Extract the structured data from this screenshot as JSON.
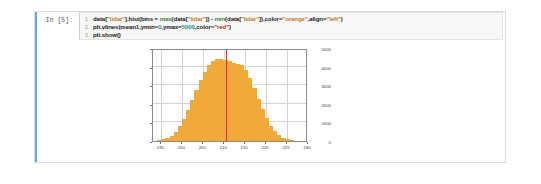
{
  "cell": {
    "prompt_label": "In [5]:",
    "code_lines": [
      {
        "number": "1",
        "segments": [
          {
            "text": "data[",
            "type": "plain"
          },
          {
            "text": "\"lidar\"",
            "type": "string"
          },
          {
            "text": "].hist(bins = ",
            "type": "plain"
          },
          {
            "text": "max",
            "type": "function"
          },
          {
            "text": "(data[",
            "type": "plain"
          },
          {
            "text": "\"lidar\"",
            "type": "string"
          },
          {
            "text": "]) - ",
            "type": "plain"
          },
          {
            "text": "min",
            "type": "function"
          },
          {
            "text": "(data[",
            "type": "plain"
          },
          {
            "text": "\"lidar\"",
            "type": "string"
          },
          {
            "text": "]),color=",
            "type": "plain"
          },
          {
            "text": "\"orange\"",
            "type": "string"
          },
          {
            "text": ",align=",
            "type": "plain"
          },
          {
            "text": "\"left\"",
            "type": "string"
          },
          {
            "text": ")",
            "type": "plain"
          }
        ]
      },
      {
        "number": "2",
        "segments": [
          {
            "text": "plt.vlines(mean1,ymin=",
            "type": "plain"
          },
          {
            "text": "0",
            "type": "number"
          },
          {
            "text": ",ymax=",
            "type": "plain"
          },
          {
            "text": "5000",
            "type": "number"
          },
          {
            "text": ",color=",
            "type": "plain"
          },
          {
            "text": "\"red\"",
            "type": "red-string"
          },
          {
            "text": ")",
            "type": "plain"
          }
        ]
      },
      {
        "number": "3",
        "segments": [
          {
            "text": "plt.show()",
            "type": "plain"
          }
        ]
      }
    ]
  },
  "colors": {
    "bar_color": "#f2a93b",
    "vline_color": "#e02b2b",
    "cell_accent": "#69a9e0",
    "code_background": "#f7f7f7"
  },
  "chart_data": {
    "type": "bar",
    "title": "",
    "xlabel": "",
    "ylabel": "",
    "xlim": [
      193,
      230
    ],
    "ylim": [
      0,
      5000
    ],
    "grid": true,
    "legend": null,
    "ytick_labels": [
      "5000",
      "4000",
      "3000",
      "2000",
      "1000",
      "0"
    ],
    "ytick_values": [
      5000,
      4000,
      3000,
      2000,
      1000,
      0
    ],
    "xtick_labels": [
      "195",
      "200",
      "205",
      "210",
      "215",
      "220",
      "225",
      "230"
    ],
    "xtick_values": [
      195,
      200,
      205,
      210,
      215,
      220,
      225,
      230
    ],
    "bin_centers": [
      193,
      194,
      195,
      196,
      197,
      198,
      199,
      200,
      201,
      202,
      203,
      204,
      205,
      206,
      207,
      208,
      209,
      210,
      211,
      212,
      213,
      214,
      215,
      216,
      217,
      218,
      219,
      220,
      221,
      222,
      223,
      224,
      225,
      226,
      227,
      228,
      229
    ],
    "values": [
      20,
      45,
      90,
      170,
      300,
      520,
      820,
      1220,
      1700,
      2250,
      2800,
      3350,
      3800,
      4150,
      4380,
      4480,
      4500,
      4460,
      4380,
      4300,
      4250,
      4150,
      3900,
      3450,
      2900,
      2300,
      1750,
      1250,
      850,
      540,
      330,
      190,
      100,
      55,
      28,
      14,
      6
    ],
    "annotations": [
      {
        "type": "vline",
        "label": "mean1",
        "x": 210.5,
        "ymin": 0,
        "ymax": 5000,
        "color": "#e02b2b"
      }
    ]
  }
}
